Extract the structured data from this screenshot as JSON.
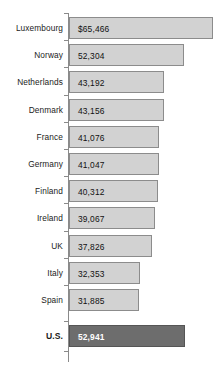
{
  "chart": {
    "type": "bar",
    "orientation": "horizontal",
    "title": "",
    "subtitle": "",
    "xlabel": "",
    "ylabel": "",
    "grid": false,
    "legend": false,
    "axis_line": true,
    "ticks": true,
    "value_labels_inside_bars": true,
    "colors": {
      "bar_fill": "#d2d2d2",
      "bar_border": "#8c8c8c",
      "highlight_fill": "#6d6d6d",
      "highlight_border": "#555555",
      "highlight_text": "#ffffff",
      "label_text": "#1b1b1b",
      "axis": "#8a8a8a",
      "background": "#ffffff"
    }
  },
  "chart_data": {
    "type": "bar",
    "title": "",
    "xlabel": "",
    "ylabel": "",
    "grid": false,
    "legend": null,
    "xlim": [
      0,
      65466
    ],
    "categories": [
      "Luxembourg",
      "Norway",
      "Netherlands",
      "Denmark",
      "France",
      "Germany",
      "Finland",
      "Ireland",
      "UK",
      "Italy",
      "Spain",
      "U.S."
    ],
    "values": [
      65466,
      52304,
      43192,
      43156,
      41076,
      41047,
      40312,
      39067,
      37826,
      32353,
      31885,
      52941
    ],
    "labels": [
      "$65,466",
      "52,304",
      "43,192",
      "43,156",
      "41,076",
      "41,047",
      "40,312",
      "39,067",
      "37,826",
      "32,353",
      "31,885",
      "52,941"
    ],
    "highlight_index": 11
  },
  "rows": [
    {
      "label": "Luxembourg",
      "value": 65466,
      "display": "$65,466",
      "highlight": false
    },
    {
      "label": "Norway",
      "value": 52304,
      "display": "52,304",
      "highlight": false
    },
    {
      "label": "Netherlands",
      "value": 43192,
      "display": "43,192",
      "highlight": false
    },
    {
      "label": "Denmark",
      "value": 43156,
      "display": "43,156",
      "highlight": false
    },
    {
      "label": "France",
      "value": 41076,
      "display": "41,076",
      "highlight": false
    },
    {
      "label": "Germany",
      "value": 41047,
      "display": "41,047",
      "highlight": false
    },
    {
      "label": "Finland",
      "value": 40312,
      "display": "40,312",
      "highlight": false
    },
    {
      "label": "Ireland",
      "value": 39067,
      "display": "39,067",
      "highlight": false
    },
    {
      "label": "UK",
      "value": 37826,
      "display": "37,826",
      "highlight": false
    },
    {
      "label": "Italy",
      "value": 32353,
      "display": "32,353",
      "highlight": false
    },
    {
      "label": "Spain",
      "value": 31885,
      "display": "31,885",
      "highlight": false
    },
    {
      "label": "U.S.",
      "value": 52941,
      "display": "52,941",
      "highlight": true
    }
  ]
}
